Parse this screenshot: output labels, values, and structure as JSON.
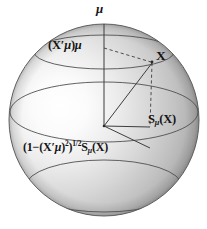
{
  "figure": {
    "type": "geometric-diagram",
    "background_color": "#ffffff",
    "sphere": {
      "center_x": 104,
      "center_y": 120,
      "radius_x": 95,
      "radius_y": 96,
      "fill_light": "#fdfdfd",
      "fill_mid": "#c9c9c9",
      "fill_dark": "#8e8e8e",
      "outline_color": "#4a4a4a",
      "highlight_x": 55,
      "highlight_y": 113
    },
    "labels": {
      "pole_axis": "μ",
      "projection": "(X′μ)μ",
      "point_x": "X",
      "tangent": "Sμ(X)",
      "tangent_scaled": "(1 − (X′μ)²)¹ᐟ²Sμ(X)"
    },
    "label_parts": {
      "mu": "μ",
      "proj_open": "(",
      "proj_x": "X",
      "proj_prime": "′",
      "proj_mu1": "μ",
      "proj_close": ")",
      "proj_mu2": "μ",
      "x": "X",
      "s": "S",
      "s_sub": "μ",
      "s_open": "(",
      "s_arg": "X",
      "s_close": ")",
      "b_open": "(",
      "b_one": "1",
      "b_minus": "−",
      "b_open2": "(",
      "b_x": "X",
      "b_prime": "′",
      "b_mu": "μ",
      "b_close2": ")",
      "b_sq": "2",
      "b_close": ")",
      "b_pow": "1/2",
      "b_s": "S",
      "b_s_sub": "μ",
      "b_s_open": "(",
      "b_s_arg": "X",
      "b_s_close": ")"
    },
    "geometry": {
      "north_pole_x": 104,
      "north_pole_y": 24,
      "center_x": 104,
      "center_y": 125,
      "point_x_x": 152,
      "point_x_y": 62,
      "foot_x": 150,
      "foot_y": 126,
      "proj_anchor_x": 105,
      "proj_anchor_y": 48,
      "tangent_tip_x": 150,
      "tangent_tip_y": 126,
      "equator_ry": 30,
      "upper_circle_ry": 16,
      "upper_circle_cy": 52,
      "lower_circle_ry": 26,
      "lower_circle_cy": 188
    },
    "stroke_colors": {
      "solid_line": "#3d3d3d",
      "dashed_line": "#3d3d3d",
      "ellipse": "#5a5a5a"
    }
  }
}
